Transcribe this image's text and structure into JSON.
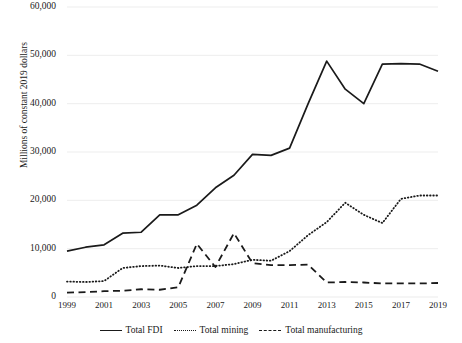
{
  "chart_data": {
    "type": "line",
    "title": "",
    "xlabel": "",
    "ylabel": "Millions of constant 2019 dollars",
    "ylim": [
      0,
      60000
    ],
    "xlim": [
      1999,
      2019
    ],
    "grid": "horizontal",
    "legend_position": "bottom",
    "ytick_labels": [
      "60,000",
      "50,000",
      "40,000",
      "30,000",
      "20,000",
      "10,000",
      "0"
    ],
    "ytick_values": [
      60000,
      50000,
      40000,
      30000,
      20000,
      10000,
      0
    ],
    "xtick_labels": [
      "1999",
      "2001",
      "2003",
      "2005",
      "2007",
      "2009",
      "2011",
      "2013",
      "2015",
      "2017",
      "2019"
    ],
    "xtick_values": [
      1999,
      2001,
      2003,
      2005,
      2007,
      2009,
      2011,
      2013,
      2015,
      2017,
      2019
    ],
    "x": [
      1999,
      2000,
      2001,
      2002,
      2003,
      2004,
      2005,
      2006,
      2007,
      2008,
      2009,
      2010,
      2011,
      2012,
      2013,
      2014,
      2015,
      2016,
      2017,
      2018,
      2019
    ],
    "series": [
      {
        "name": "Total FDI",
        "style": "solid",
        "color": "#1a1a1a",
        "values": [
          9500,
          10300,
          10800,
          13200,
          13400,
          17000,
          17000,
          19000,
          22600,
          25200,
          29500,
          29300,
          30800,
          40000,
          48800,
          43000,
          40000,
          48200,
          48300,
          48200,
          46700
        ]
      },
      {
        "name": "Total mining",
        "style": "dotted",
        "color": "#1a1a1a",
        "values": [
          3200,
          3100,
          3300,
          6000,
          6400,
          6500,
          6000,
          6400,
          6400,
          6800,
          7700,
          7500,
          9500,
          12800,
          15500,
          19500,
          17000,
          15300,
          20300,
          21000,
          21000
        ]
      },
      {
        "name": "Total manufacturing",
        "style": "dashed",
        "color": "#1a1a1a",
        "values": [
          900,
          1000,
          1200,
          1300,
          1600,
          1500,
          2000,
          11000,
          6200,
          13200,
          7000,
          6600,
          6600,
          6700,
          3000,
          3100,
          3000,
          2800,
          2800,
          2800,
          2900
        ]
      }
    ]
  }
}
